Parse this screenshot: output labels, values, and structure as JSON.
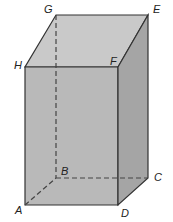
{
  "figure": {
    "type": "rectangular prism",
    "colors": {
      "top_face": "#c9c9c9",
      "front_face": "#b8b8b8",
      "right_face": "#a6a6a6",
      "edge": "#333333",
      "hidden_edge": "#444444"
    },
    "vertices": {
      "A": {
        "label": "A"
      },
      "B": {
        "label": "B"
      },
      "C": {
        "label": "C"
      },
      "D": {
        "label": "D"
      },
      "E": {
        "label": "E"
      },
      "F": {
        "label": "F"
      },
      "G": {
        "label": "G"
      },
      "H": {
        "label": "H"
      }
    },
    "hidden_edges": [
      "GB",
      "AB",
      "BC"
    ]
  }
}
